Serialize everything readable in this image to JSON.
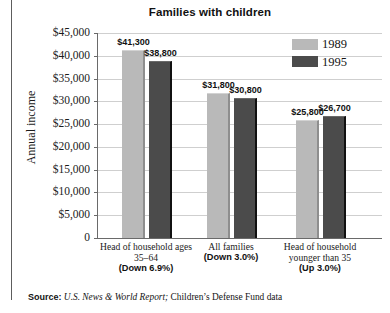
{
  "chart_data": {
    "type": "bar",
    "title": "Families with children",
    "xlabel": "",
    "ylabel": "Annual income",
    "ylim": [
      0,
      45000
    ],
    "ytick_values": [
      0,
      5000,
      10000,
      15000,
      20000,
      25000,
      30000,
      35000,
      40000,
      45000
    ],
    "ytick_labels": [
      "0",
      "$5,000",
      "$10,000",
      "$15,000",
      "$20,000",
      "$25,000",
      "$30,000",
      "$35,000",
      "$40,000",
      "$45,000"
    ],
    "grid": true,
    "legend_position": "top-right",
    "categories": [
      "Head of household ages 35–64",
      "All families",
      "Head of household younger than 35"
    ],
    "category_lines": [
      [
        "Head of household ages",
        "35–64"
      ],
      [
        "All families"
      ],
      [
        "Head of household",
        "younger than 35"
      ]
    ],
    "category_changes": [
      "(Down 6.9%)",
      "(Down 3.0%)",
      "(Up 3.0%)"
    ],
    "series": [
      {
        "name": "1989",
        "color": "#b9b9b9",
        "values": [
          41300,
          31800,
          25800
        ],
        "data_labels": [
          "$41,300",
          "$31,800",
          "$25,800"
        ]
      },
      {
        "name": "1995",
        "color": "#4b4b4b",
        "values": [
          38800,
          30800,
          26700
        ],
        "data_labels": [
          "$38,800",
          "$30,800",
          "$26,700"
        ]
      }
    ]
  },
  "legend": [
    {
      "label": "1989",
      "swatch": "light"
    },
    {
      "label": "1995",
      "swatch": "dark"
    }
  ],
  "source": {
    "label": "Source:",
    "publication": "U.S. News & World Report;",
    "rest": "Children’s Defense Fund data"
  }
}
